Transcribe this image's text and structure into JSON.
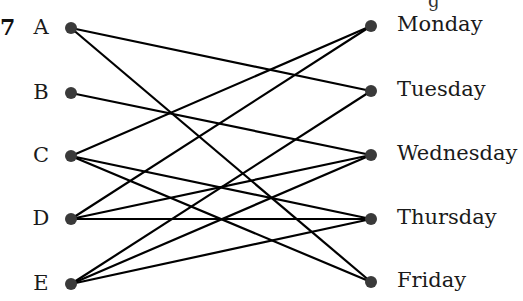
{
  "question_number": "7",
  "top_fragment": "g",
  "colors": {
    "node": "#3a3a3a",
    "edge": "#000000",
    "text": "#1a1a1a"
  },
  "left_nodes": [
    {
      "id": "A",
      "label": "A",
      "x": 71,
      "y": 28
    },
    {
      "id": "B",
      "label": "B",
      "x": 71,
      "y": 93
    },
    {
      "id": "C",
      "label": "C",
      "x": 71,
      "y": 156
    },
    {
      "id": "D",
      "label": "D",
      "x": 71,
      "y": 219
    },
    {
      "id": "E",
      "label": "E",
      "x": 71,
      "y": 284
    }
  ],
  "right_nodes": [
    {
      "id": "Mon",
      "label": "Monday",
      "x": 371,
      "y": 26
    },
    {
      "id": "Tue",
      "label": "Tuesday",
      "x": 371,
      "y": 91
    },
    {
      "id": "Wed",
      "label": "Wednesday",
      "x": 371,
      "y": 155
    },
    {
      "id": "Thu",
      "label": "Thursday",
      "x": 371,
      "y": 219
    },
    {
      "id": "Fri",
      "label": "Friday",
      "x": 371,
      "y": 282
    }
  ],
  "edges": [
    [
      "A",
      "Tue"
    ],
    [
      "A",
      "Fri"
    ],
    [
      "B",
      "Wed"
    ],
    [
      "C",
      "Mon"
    ],
    [
      "C",
      "Thu"
    ],
    [
      "C",
      "Fri"
    ],
    [
      "D",
      "Mon"
    ],
    [
      "D",
      "Wed"
    ],
    [
      "D",
      "Thu"
    ],
    [
      "E",
      "Tue"
    ],
    [
      "E",
      "Wed"
    ],
    [
      "E",
      "Thu"
    ]
  ]
}
